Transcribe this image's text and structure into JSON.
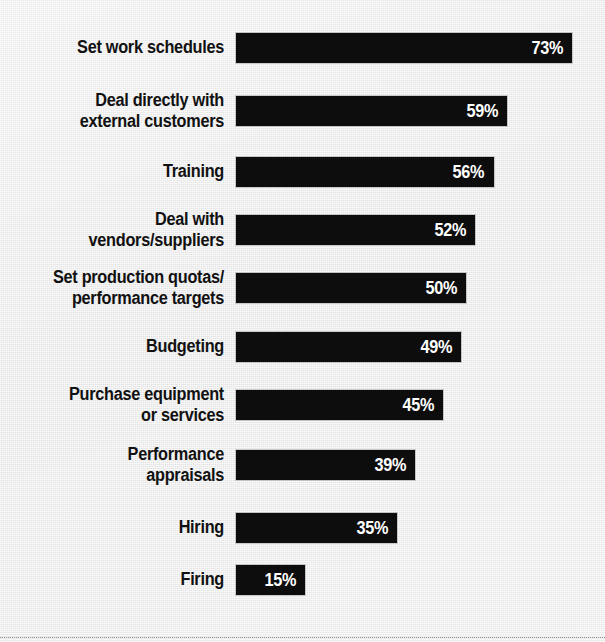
{
  "chart_data": {
    "type": "bar",
    "orientation": "horizontal",
    "title": "",
    "subtitle": "",
    "xlabel": "",
    "ylabel": "",
    "xlim": [
      0,
      75
    ],
    "grid": false,
    "legend": null,
    "value_suffix": "%",
    "categories": [
      "Set work schedules",
      "Deal directly with\nexternal customers",
      "Training",
      "Deal with\nvendors/suppliers",
      "Set production quotas/\nperformance targets",
      "Budgeting",
      "Purchase equipment\nor services",
      "Performance\nappraisals",
      "Hiring",
      "Firing"
    ],
    "values": [
      73,
      59,
      56,
      52,
      50,
      49,
      45,
      39,
      35,
      15
    ],
    "value_labels": [
      "73%",
      "59%",
      "56%",
      "52%",
      "50%",
      "49%",
      "45%",
      "39%",
      "35%",
      "15%"
    ],
    "bars": [
      {
        "label": "Set work schedules",
        "value": 73,
        "value_label": "73%",
        "lines": 1,
        "top": 33
      },
      {
        "label": "Deal directly with\nexternal customers",
        "value": 59,
        "value_label": "59%",
        "lines": 2,
        "top": 96
      },
      {
        "label": "Training",
        "value": 56,
        "value_label": "56%",
        "lines": 1,
        "top": 157
      },
      {
        "label": "Deal with\nvendors/suppliers",
        "value": 52,
        "value_label": "52%",
        "lines": 2,
        "top": 215
      },
      {
        "label": "Set production quotas/\nperformance targets",
        "value": 50,
        "value_label": "50%",
        "lines": 2,
        "top": 273
      },
      {
        "label": "Budgeting",
        "value": 49,
        "value_label": "49%",
        "lines": 1,
        "top": 332
      },
      {
        "label": "Purchase equipment\nor services",
        "value": 45,
        "value_label": "45%",
        "lines": 2,
        "top": 390
      },
      {
        "label": "Performance\nappraisals",
        "value": 39,
        "value_label": "39%",
        "lines": 2,
        "top": 450
      },
      {
        "label": "Hiring",
        "value": 35,
        "value_label": "35%",
        "lines": 1,
        "top": 513
      },
      {
        "label": "Firing",
        "value": 15,
        "value_label": "15%",
        "lines": 1,
        "top": 565
      }
    ],
    "colors": {
      "bar": "#0d0d0d",
      "background": "#ededed",
      "label_text": "#111111",
      "value_text": "#ffffff",
      "rule": "#8d8d8d"
    }
  }
}
